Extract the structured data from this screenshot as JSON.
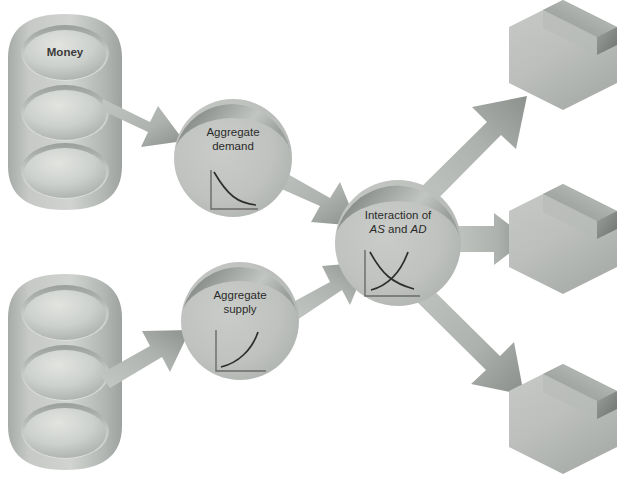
{
  "diagram": {
    "background_color": "#ffffff"
  },
  "palette": {
    "body_fill": "#b9bcb8",
    "body_fill_light": "#c9ccc8",
    "bevel_dark": "#7f837f",
    "bevel_mid": "#9ea29e",
    "arrow_fill": "#b0b4b0",
    "arrow_dark": "#8a8e8a",
    "curve_stroke": "#3a3a3a",
    "axis_stroke": "#6a6a6a",
    "text_color": "#2b2b2b"
  },
  "cylinders": [
    {
      "id": "money-cylinder",
      "label": "Money",
      "has_label": true,
      "disc_count": 3,
      "x": 8,
      "y": 14,
      "width": 114,
      "height": 196
    },
    {
      "id": "lower-cylinder",
      "label": "",
      "has_label": false,
      "disc_count": 3,
      "x": 8,
      "y": 274,
      "width": 114,
      "height": 196
    }
  ],
  "circles": [
    {
      "id": "aggregate-demand",
      "line1": "Aggregate",
      "line2": "demand",
      "chart": "downward-sloping-demand-curve",
      "cx": 233,
      "cy": 158,
      "r": 59
    },
    {
      "id": "aggregate-supply",
      "line1": "Aggregate",
      "line2": "supply",
      "chart": "upward-sloping-supply-curve",
      "cx": 240,
      "cy": 321,
      "r": 59
    },
    {
      "id": "interaction-as-ad",
      "line1": "Interaction of",
      "line2_pre": "AS",
      "line2_mid": " and ",
      "line2_post": "AD",
      "chart": "crossing-as-ad-curves",
      "cx": 398,
      "cy": 243,
      "r": 63
    }
  ],
  "hexagons": [
    {
      "id": "outcome-hex-top",
      "label": "",
      "cx": 563,
      "cy": 55,
      "rx": 54,
      "ry": 55
    },
    {
      "id": "outcome-hex-middle",
      "label": "",
      "cx": 563,
      "cy": 239,
      "rx": 54,
      "ry": 55
    },
    {
      "id": "outcome-hex-bottom",
      "label": "",
      "cx": 563,
      "cy": 419,
      "rx": 54,
      "ry": 55
    }
  ],
  "arrows": [
    {
      "id": "arrow-money-to-demand",
      "from": "money-cylinder",
      "to": "aggregate-demand",
      "direction": "down-right"
    },
    {
      "id": "arrow-lower-to-supply",
      "from": "lower-cylinder",
      "to": "aggregate-supply",
      "direction": "up-right"
    },
    {
      "id": "arrow-demand-to-interaction",
      "from": "aggregate-demand",
      "to": "interaction-as-ad",
      "direction": "down-right"
    },
    {
      "id": "arrow-supply-to-interaction",
      "from": "aggregate-supply",
      "to": "interaction-as-ad",
      "direction": "up-right"
    },
    {
      "id": "arrow-interaction-to-hex-top",
      "from": "interaction-as-ad",
      "to": "outcome-hex-top",
      "direction": "up-right"
    },
    {
      "id": "arrow-interaction-to-hex-middle",
      "from": "interaction-as-ad",
      "to": "outcome-hex-middle",
      "direction": "right"
    },
    {
      "id": "arrow-interaction-to-hex-bottom",
      "from": "interaction-as-ad",
      "to": "outcome-hex-bottom",
      "direction": "down-right"
    }
  ]
}
